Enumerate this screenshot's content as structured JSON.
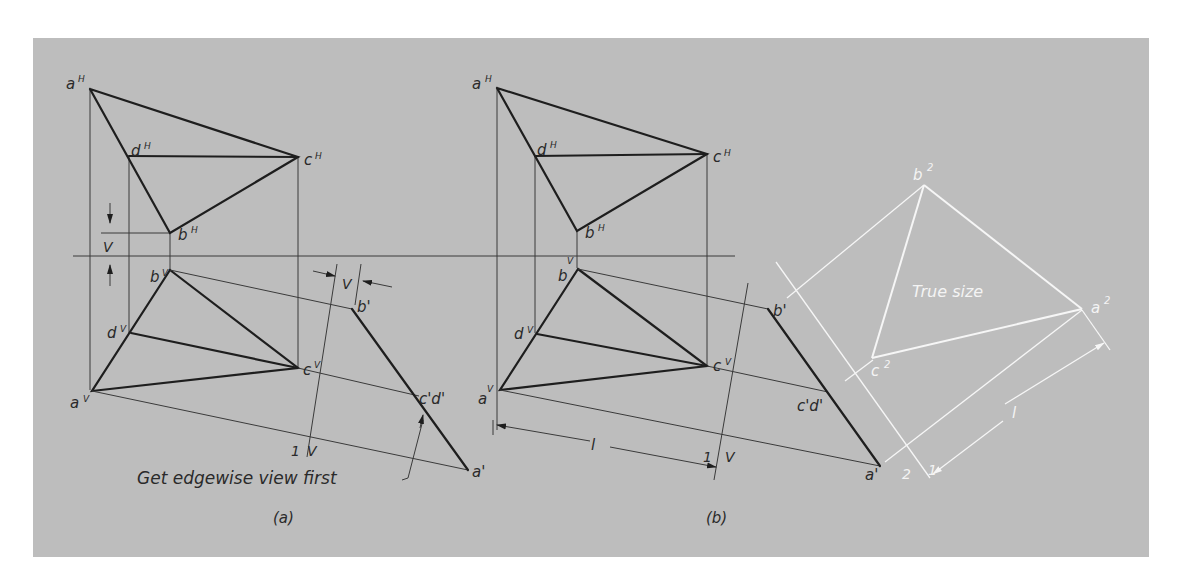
{
  "figure": {
    "part_a": {
      "caption": "(a)",
      "note": "Get edgewise view first",
      "labels": {
        "aH": "a",
        "aH_sup": "H",
        "dH": "d",
        "dH_sup": "H",
        "cH": "c",
        "cH_sup": "H",
        "bH": "b",
        "bH_sup": "H",
        "bV": "b",
        "bV_sup": "V",
        "dV": "d",
        "dV_sup": "V",
        "cV": "c",
        "cV_sup": "V",
        "aV": "a",
        "aV_sup": "V",
        "b1": "b'",
        "cd1": "c'd'",
        "a1": "a'",
        "dim_v_left": "V",
        "dim_v_aux": "V",
        "fold_1": "1",
        "fold_V": "V"
      }
    },
    "part_b": {
      "caption": "(b)",
      "true_size": "True size",
      "labels": {
        "aH": "a",
        "aH_sup": "H",
        "dH": "d",
        "dH_sup": "H",
        "cH": "c",
        "cH_sup": "H",
        "bH": "b",
        "bH_sup": "H",
        "bV": "b",
        "bV_sup": "V",
        "dV": "d",
        "dV_sup": "V",
        "cV": "c",
        "cV_sup": "V",
        "aV": "a",
        "aV_sup": "V",
        "b1": "b'",
        "cd1": "c'd'",
        "a1": "a'",
        "dim_l": "l",
        "fold_1": "1",
        "fold_V": "V",
        "b2": "b",
        "b2_sup": "2",
        "a2": "a",
        "a2_sup": "2",
        "c2": "c",
        "c2_sup": "2",
        "fold_2": "2",
        "fold_1b": "1",
        "dim_l2": "l"
      }
    },
    "colors": {
      "panel": "#bdbdbd",
      "ink": "#1e1e1e",
      "white_ink": "#f6f6f6"
    }
  }
}
